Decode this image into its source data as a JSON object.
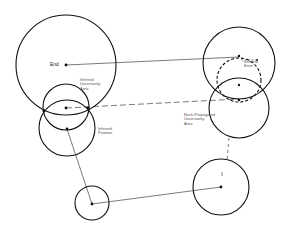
{
  "diagram": {
    "labels": {
      "end": "End",
      "inferred_uncertainty_area": "Inferred\nUncertainty\nArea",
      "inferred_position": "Inferred\nPosition",
      "inferred_error": "Inferred\nError",
      "back_propagated_uncertainty_area": "Back-Propagated\nUncertainty\nArea",
      "start_marker": "Start"
    },
    "colors": {
      "stroke": "#111111",
      "text": "#555555",
      "background": "#ffffff"
    }
  }
}
